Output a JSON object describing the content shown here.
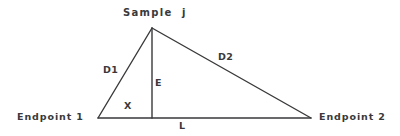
{
  "figure": {
    "kind": "geometry-diagram",
    "stroke_color": "#39393b",
    "background_color": "#ffffff",
    "line_width": 1.4
  },
  "labels": {
    "sample": "Sample  j",
    "endpoint_1": "Endpoint 1",
    "endpoint_2": "Endpoint 2",
    "d1": "D1",
    "d2": "D2",
    "e": "E",
    "x": "X",
    "l": "L"
  },
  "geometry": {
    "vertices": {
      "endpoint_1": {
        "x": 98,
        "y": 118
      },
      "endpoint_2": {
        "x": 311,
        "y": 118
      },
      "sample_j": {
        "x": 152,
        "y": 28
      },
      "foot": {
        "x": 152,
        "y": 118
      }
    },
    "segments": [
      {
        "name": "D1",
        "from": "endpoint_1",
        "to": "sample_j"
      },
      {
        "name": "D2",
        "from": "sample_j",
        "to": "endpoint_2"
      },
      {
        "name": "L",
        "from": "endpoint_1",
        "to": "endpoint_2"
      },
      {
        "name": "E",
        "from": "sample_j",
        "to": "foot"
      }
    ]
  }
}
